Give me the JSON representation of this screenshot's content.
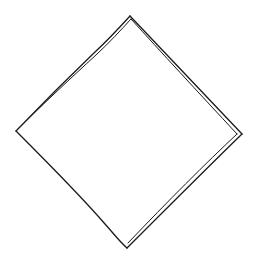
{
  "figure": {
    "shape": "diamond",
    "stroke_color": "#1a1a1a",
    "background_color": "#ffffff",
    "vertices": {
      "top": [
        130,
        16
      ],
      "right": [
        242,
        134
      ],
      "bottom": [
        127,
        248
      ],
      "left": [
        16,
        131
      ]
    },
    "doubled_edges": [
      "top-left",
      "top-right",
      "bottom-right"
    ],
    "single_edges": [
      "bottom-left"
    ]
  }
}
